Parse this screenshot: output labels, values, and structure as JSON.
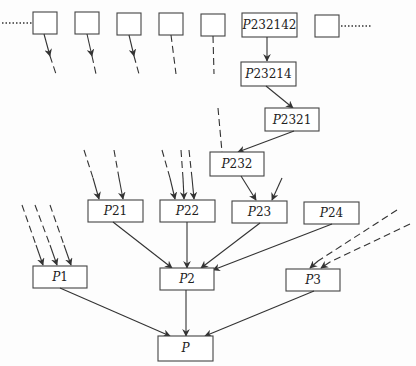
{
  "diagram": {
    "type": "tree",
    "nodes": [
      {
        "id": "s1",
        "label": ""
      },
      {
        "id": "s2",
        "label": ""
      },
      {
        "id": "s3",
        "label": ""
      },
      {
        "id": "s4",
        "label": ""
      },
      {
        "id": "s5",
        "label": ""
      },
      {
        "id": "P232142",
        "label_prefix": "P",
        "label_suffix": "232142"
      },
      {
        "id": "s7",
        "label": ""
      },
      {
        "id": "P23214",
        "label_prefix": "P",
        "label_suffix": "23214"
      },
      {
        "id": "P2321",
        "label_prefix": "P",
        "label_suffix": "2321"
      },
      {
        "id": "P232",
        "label_prefix": "P",
        "label_suffix": "232"
      },
      {
        "id": "P21",
        "label_prefix": "P",
        "label_suffix": "21"
      },
      {
        "id": "P22",
        "label_prefix": "P",
        "label_suffix": "22"
      },
      {
        "id": "P23",
        "label_prefix": "P",
        "label_suffix": "23"
      },
      {
        "id": "P24",
        "label_prefix": "P",
        "label_suffix": "24"
      },
      {
        "id": "P1",
        "label_prefix": "P",
        "label_suffix": "1"
      },
      {
        "id": "P2",
        "label_prefix": "P",
        "label_suffix": "2"
      },
      {
        "id": "P3",
        "label_prefix": "P",
        "label_suffix": "3"
      },
      {
        "id": "P",
        "label_prefix": "P",
        "label_suffix": ""
      }
    ],
    "edges": [
      {
        "from": "P232142",
        "to": "P23214",
        "style": "solid"
      },
      {
        "from": "P23214",
        "to": "P2321",
        "style": "solid"
      },
      {
        "from": "P2321",
        "to": "P232",
        "style": "solid"
      },
      {
        "from": "P232",
        "to": "P23",
        "style": "solid"
      },
      {
        "from": "P21",
        "to": "P2",
        "style": "solid"
      },
      {
        "from": "P22",
        "to": "P2",
        "style": "solid"
      },
      {
        "from": "P23",
        "to": "P2",
        "style": "solid"
      },
      {
        "from": "P24",
        "to": "P2",
        "style": "solid"
      },
      {
        "from": "P1",
        "to": "P",
        "style": "solid"
      },
      {
        "from": "P2",
        "to": "P",
        "style": "solid"
      },
      {
        "from": "P3",
        "to": "P",
        "style": "solid"
      }
    ],
    "continuation_marks": [
      "dotted-left",
      "dotted-right"
    ]
  }
}
